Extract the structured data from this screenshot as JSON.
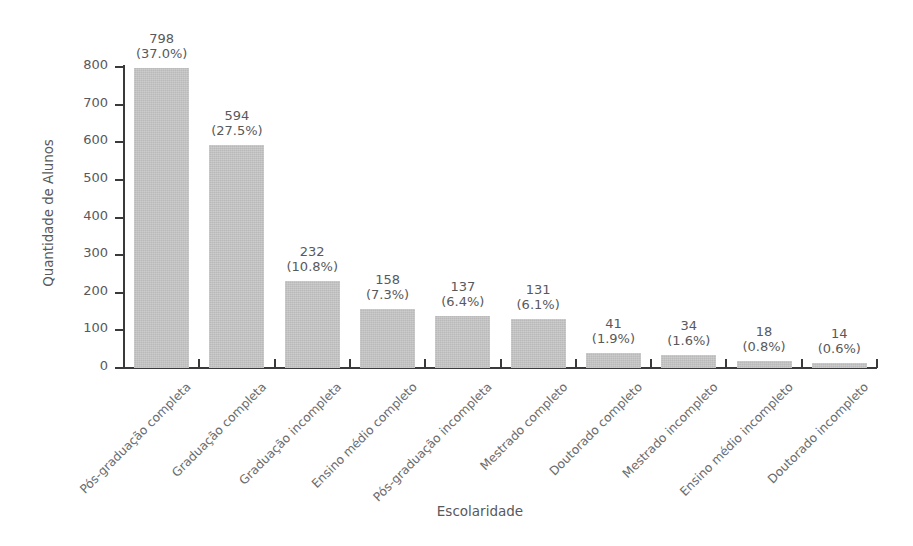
{
  "chart_data": {
    "type": "bar",
    "title": "",
    "xlabel": "Escolaridade",
    "ylabel": "Quantidade de Alunos",
    "ylim": [
      0,
      800
    ],
    "yticks": [
      0,
      100,
      200,
      300,
      400,
      500,
      600,
      700,
      800
    ],
    "grid": false,
    "legend": null,
    "bar_color": "#c2c2c2",
    "text_color": "#58595b",
    "axis_color": "#3a3a3c",
    "background": "#ffffff",
    "categories": [
      "Pós-graduação completa",
      "Graduação completa",
      "Graduação incompleta",
      "Ensino médio completo",
      "Pós-graduação incompleta",
      "Mestrado completo",
      "Doutorado completo",
      "Mestrado incompleto",
      "Ensino médio incompleto",
      "Doutorado incompleto"
    ],
    "values": [
      798,
      594,
      232,
      158,
      137,
      131,
      41,
      34,
      18,
      14
    ],
    "percent_labels": [
      "(37.0%)",
      "(27.5%)",
      "(10.8%)",
      "(7.3%)",
      "(6.4%)",
      "(6.1%)",
      "(1.9%)",
      "(1.6%)",
      "(0.8%)",
      "(0.6%)"
    ],
    "percents": [
      37.0,
      27.5,
      10.8,
      7.3,
      6.4,
      6.1,
      1.9,
      1.6,
      0.8,
      0.6
    ],
    "value_labels": [
      "798",
      "594",
      "232",
      "158",
      "137",
      "131",
      "41",
      "34",
      "18",
      "14"
    ]
  }
}
